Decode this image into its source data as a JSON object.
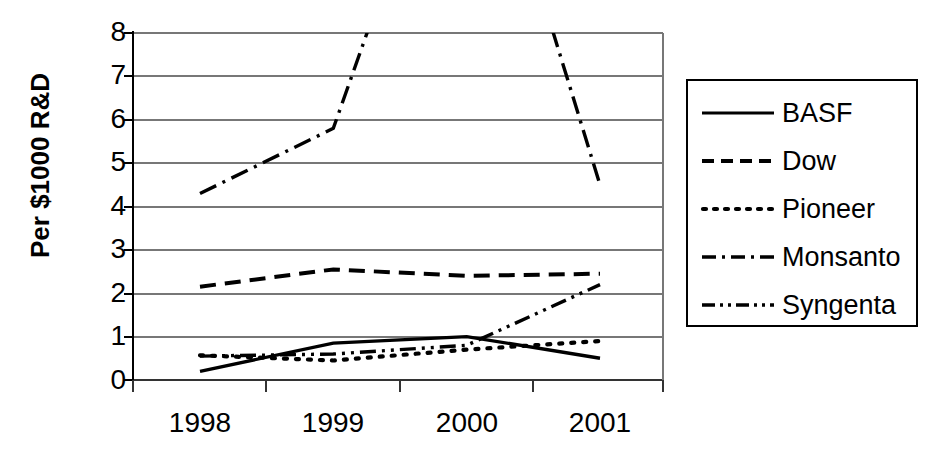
{
  "chart_data": {
    "type": "line",
    "title": "",
    "xlabel": "",
    "ylabel": "Per $1000 R&D",
    "categories": [
      "1998",
      "1999",
      "2000",
      "2001"
    ],
    "x": [
      1998,
      1999,
      2000,
      2001
    ],
    "ylim": [
      0,
      8
    ],
    "yticks": [
      "0",
      "1",
      "2",
      "3",
      "4",
      "5",
      "6",
      "7",
      "8"
    ],
    "grid": true,
    "legend_position": "right",
    "note": "Monsanto and Syngenta exceed the y-axis maximum of 8 between 1999 and 2001; their lines are clipped at the top of the plot area.",
    "series": [
      {
        "name": "BASF",
        "style": "solid",
        "values": [
          0.2,
          0.85,
          1.0,
          0.5
        ]
      },
      {
        "name": "Dow",
        "style": "dashed",
        "values": [
          2.15,
          2.55,
          2.4,
          2.45
        ]
      },
      {
        "name": "Pioneer",
        "style": "dotted",
        "values": [
          0.57,
          0.45,
          0.7,
          0.9
        ]
      },
      {
        "name": "Monsanto",
        "style": "dash-dot",
        "values": [
          4.3,
          5.8,
          14.5,
          4.5
        ]
      },
      {
        "name": "Syngenta",
        "style": "dash-dot-dot",
        "values": [
          0.55,
          0.6,
          0.8,
          2.2
        ]
      }
    ]
  },
  "axes": {
    "y_title": "Per $1000 R&D",
    "y_tick_labels": [
      "8",
      "7",
      "6",
      "5",
      "4",
      "3",
      "2",
      "1",
      "0"
    ],
    "x_tick_labels": [
      "1998",
      "1999",
      "2000",
      "2001"
    ]
  },
  "legend": {
    "entries": [
      {
        "label": "BASF"
      },
      {
        "label": "Dow"
      },
      {
        "label": "Pioneer"
      },
      {
        "label": "Monsanto"
      },
      {
        "label": "Syngenta"
      }
    ]
  },
  "colors": {
    "line": "#000000",
    "grid": "#808080",
    "axis": "#000000",
    "background": "#ffffff"
  }
}
